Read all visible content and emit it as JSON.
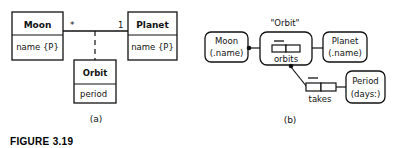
{
  "figure": {
    "caption": "FIGURE 3.19"
  },
  "diagram_a": {
    "label": "(a)",
    "classes": [
      {
        "name": "Moon",
        "attribute": "name {P}"
      },
      {
        "name": "Planet",
        "attribute": "name {P}"
      }
    ],
    "association": {
      "moon_multiplicity": "*",
      "planet_multiplicity": "1"
    },
    "association_class": {
      "name": "Orbit",
      "attribute": "period"
    }
  },
  "diagram_b": {
    "label": "(b)",
    "objects": [
      {
        "line1": "Moon",
        "line2": "(.name)"
      },
      {
        "line1": "Planet",
        "line2": "(.name)"
      },
      {
        "line1": "Period",
        "line2": "(days:)"
      }
    ],
    "objectified_title": "\"Orbit\"",
    "facts": [
      {
        "label": "orbits"
      },
      {
        "label": "takes"
      }
    ]
  },
  "colors": {
    "stroke": "#111111",
    "background": "#ffffff"
  }
}
